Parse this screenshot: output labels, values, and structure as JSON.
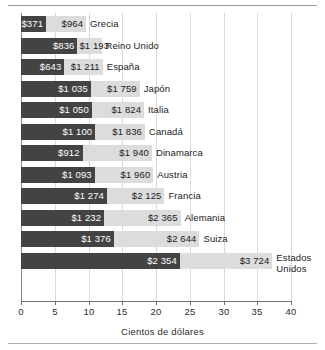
{
  "figure": {
    "xlabel": "Cientos de dólares",
    "colors": {
      "dark_bar": "#434343",
      "light_bar": "#dcdcdc",
      "grid": "#d9d9d9",
      "axis": "#6f6f6f",
      "text": "#1b1b1b"
    }
  },
  "chart_data": {
    "type": "bar",
    "orientation": "horizontal",
    "title": "",
    "subtitle": "",
    "xlabel": "Cientos de dólares",
    "ylabel": "",
    "xlim": [
      0,
      40
    ],
    "xticks": [
      0,
      5,
      10,
      15,
      20,
      25,
      30,
      35,
      40
    ],
    "xticklabels": [
      "0",
      "5",
      "10",
      "15",
      "20",
      "25",
      "30",
      "35",
      "40"
    ],
    "grid": "vertical",
    "legend": "none",
    "units": "cientos de dólares",
    "note": "Cada país tiene dos barras trazadas desde cero: una barra oscura (valor menor) superpuesta sobre una barra clara (valor mayor). Las etiquetas de valor se alinean al final de cada barra.",
    "categories": [
      "Grecia",
      "Reino Unido",
      "España",
      "Japón",
      "Italia",
      "Canadá",
      "Dinamarca",
      "Austria",
      "Francia",
      "Alemania",
      "Suiza",
      "Estados Unidos"
    ],
    "series": [
      {
        "name": "dark",
        "values": [
          3.71,
          8.36,
          6.43,
          10.35,
          10.5,
          11.0,
          9.12,
          10.93,
          12.74,
          12.32,
          13.76,
          23.54
        ],
        "labels": [
          "$371",
          "$836",
          "$643",
          "$1 035",
          "$1 050",
          "$1 100",
          "$912",
          "$1 093",
          "$1 274",
          "$1 232",
          "$1 376",
          "$2 354"
        ]
      },
      {
        "name": "light",
        "values": [
          9.64,
          11.93,
          12.11,
          17.59,
          18.24,
          18.36,
          19.4,
          19.6,
          21.25,
          23.65,
          26.44,
          37.24
        ],
        "labels": [
          "$964",
          "$1 193",
          "$1 211",
          "$1 759",
          "$1 824",
          "$1 836",
          "$1 940",
          "$1 960",
          "$2 125",
          "$2 365",
          "$2 644",
          "$3 724"
        ]
      }
    ],
    "rows": [
      {
        "country": "Grecia",
        "dark_label": "$371",
        "dark_value": 3.71,
        "light_label": "$964",
        "light_value": 9.64,
        "multiline_name": false
      },
      {
        "country": "Reino Unido",
        "dark_label": "$836",
        "dark_value": 8.36,
        "light_label": "$1 193",
        "light_value": 11.93,
        "multiline_name": false
      },
      {
        "country": "España",
        "dark_label": "$643",
        "dark_value": 6.43,
        "light_label": "$1 211",
        "light_value": 12.11,
        "multiline_name": false
      },
      {
        "country": "Japón",
        "dark_label": "$1 035",
        "dark_value": 10.35,
        "light_label": "$1 759",
        "light_value": 17.59,
        "multiline_name": false
      },
      {
        "country": "Italia",
        "dark_label": "$1 050",
        "dark_value": 10.5,
        "light_label": "$1 824",
        "light_value": 18.24,
        "multiline_name": false
      },
      {
        "country": "Canadá",
        "dark_label": "$1 100",
        "dark_value": 11.0,
        "light_label": "$1 836",
        "light_value": 18.36,
        "multiline_name": false
      },
      {
        "country": "Dinamarca",
        "dark_label": "$912",
        "dark_value": 9.12,
        "light_label": "$1 940",
        "light_value": 19.4,
        "multiline_name": false
      },
      {
        "country": "Austria",
        "dark_label": "$1 093",
        "dark_value": 10.93,
        "light_label": "$1 960",
        "light_value": 19.6,
        "multiline_name": false
      },
      {
        "country": "Francia",
        "dark_label": "$1 274",
        "dark_value": 12.74,
        "light_label": "$2 125",
        "light_value": 21.25,
        "multiline_name": false
      },
      {
        "country": "Alemania",
        "dark_label": "$1 232",
        "dark_value": 12.32,
        "light_label": "$2 365",
        "light_value": 23.65,
        "multiline_name": false
      },
      {
        "country": "Suiza",
        "dark_label": "$1 376",
        "dark_value": 13.76,
        "light_label": "$2 644",
        "light_value": 26.44,
        "multiline_name": false
      },
      {
        "country": "Estados\nUnidos",
        "dark_label": "$2 354",
        "dark_value": 23.54,
        "light_label": "$3 724",
        "light_value": 37.24,
        "multiline_name": true
      }
    ]
  }
}
